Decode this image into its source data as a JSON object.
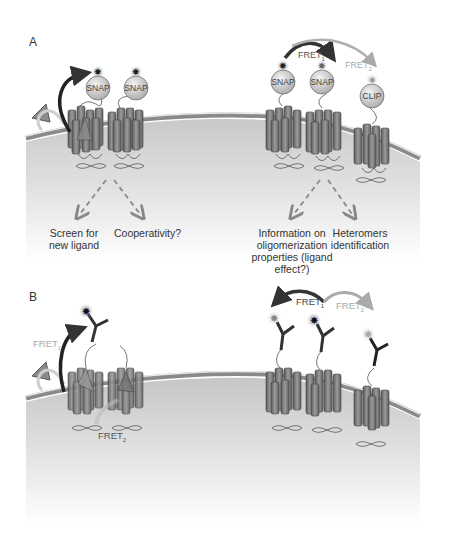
{
  "figure": {
    "panel_a": {
      "label": "A",
      "left_group": {
        "receptors": [
          {
            "tag": "SNAP",
            "has_ligand": true
          },
          {
            "tag": "SNAP",
            "has_ligand": false
          }
        ],
        "outcomes": [
          {
            "line1": "Screen for",
            "line2": "new ligand"
          },
          {
            "line1": "Cooperativity?",
            "line2": ""
          }
        ]
      },
      "right_group": {
        "receptors": [
          {
            "tag": "SNAP"
          },
          {
            "tag": "SNAP"
          },
          {
            "tag": "CLIP"
          }
        ],
        "fret_labels": [
          {
            "text": "FRET",
            "sub": "1"
          },
          {
            "text": "FRET",
            "sub": "2"
          }
        ],
        "outcomes": [
          {
            "line1": "Information on",
            "line2": "oligomerization",
            "line3": "properties (ligand",
            "line4": "effect?)"
          },
          {
            "line1": "Heteromers",
            "line2": "identification"
          }
        ]
      }
    },
    "panel_b": {
      "label": "B",
      "left_group": {
        "fret_labels": [
          {
            "text": "FRET",
            "sub": "1"
          },
          {
            "text": "FRET",
            "sub": "2"
          }
        ]
      },
      "right_group": {
        "fret_labels": [
          {
            "text": "FRET",
            "sub": "1"
          },
          {
            "text": "FRET",
            "sub": "2"
          }
        ]
      }
    },
    "colors": {
      "membrane": "#9a9a9a",
      "cytoplasm": "#d8d8d8",
      "receptor": "#7a7a7a",
      "fret1": "#3a3a3a",
      "fret2": "#a8a8a8",
      "arrow": "#888888"
    }
  }
}
